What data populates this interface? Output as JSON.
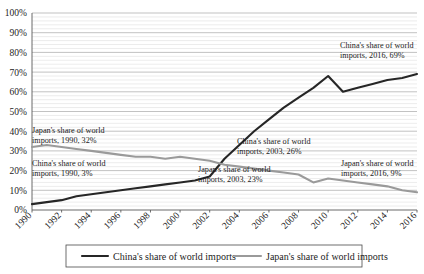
{
  "chart_data": {
    "type": "line",
    "title": "",
    "xlabel": "",
    "ylabel": "",
    "ylim": [
      0,
      100
    ],
    "xlim": [
      1990,
      2016
    ],
    "grid": true,
    "legend_position": "bottom",
    "y_ticks": [
      "0%",
      "10%",
      "20%",
      "30%",
      "40%",
      "50%",
      "60%",
      "70%",
      "80%",
      "90%",
      "100%"
    ],
    "y_tick_values": [
      0,
      10,
      20,
      30,
      40,
      50,
      60,
      70,
      80,
      90,
      100
    ],
    "x_ticks": [
      "1990",
      "1992",
      "1994",
      "1996",
      "1998",
      "2000",
      "2002",
      "2004",
      "2006",
      "2008",
      "2010",
      "2012",
      "2014",
      "2016"
    ],
    "x": [
      1990,
      1991,
      1992,
      1993,
      1994,
      1995,
      1996,
      1997,
      1998,
      1999,
      2000,
      2001,
      2002,
      2003,
      2004,
      2005,
      2006,
      2007,
      2008,
      2009,
      2010,
      2011,
      2012,
      2013,
      2014,
      2015,
      2016
    ],
    "series": [
      {
        "name": "China's share of world imports",
        "color": "#262626",
        "values": [
          3,
          4,
          5,
          7,
          8,
          9,
          10,
          11,
          12,
          13,
          14,
          15,
          17,
          26,
          33,
          40,
          46,
          52,
          57,
          62,
          68,
          60,
          62,
          64,
          66,
          67,
          69
        ]
      },
      {
        "name": "Japan's share of world imports",
        "color": "#9a9a9a",
        "values": [
          32,
          33,
          32,
          31,
          30,
          29,
          28,
          27,
          27,
          26,
          27,
          26,
          25,
          23,
          22,
          21,
          20,
          19,
          18,
          14,
          16,
          15,
          14,
          13,
          12,
          10,
          9
        ]
      }
    ],
    "annotations": [
      {
        "id": "japan-1990",
        "text_line1": "Japan's share of world",
        "text_line2": "imports, 1990, 32%",
        "x": 32,
        "y": 133,
        "value": 32,
        "year": 1990,
        "series": "japan"
      },
      {
        "id": "china-1990",
        "text_line1": "China's share of world",
        "text_line2": "imports, 1990, 3%",
        "x": 32,
        "y": 166,
        "value": 3,
        "year": 1990,
        "series": "china"
      },
      {
        "id": "china-2003",
        "text_line1": "China's share of world",
        "text_line2": "imports, 2003, 26%",
        "x": 237,
        "y": 144,
        "value": 26,
        "year": 2003,
        "series": "china"
      },
      {
        "id": "japan-2003",
        "text_line1": "Japan's share of world",
        "text_line2": "imports, 2003, 23%",
        "x": 198,
        "y": 172,
        "value": 23,
        "year": 2003,
        "series": "japan"
      },
      {
        "id": "china-2016",
        "text_line1": "China's share of world",
        "text_line2": "imports, 2016, 69%",
        "x": 340,
        "y": 48,
        "value": 69,
        "year": 2016,
        "series": "china"
      },
      {
        "id": "japan-2016",
        "text_line1": "Japan's share of world",
        "text_line2": "imports, 2016, 9%",
        "x": 341,
        "y": 166,
        "value": 9,
        "year": 2016,
        "series": "japan"
      }
    ]
  },
  "legend": {
    "items": [
      {
        "label": "China's share of world imports",
        "color": "#262626"
      },
      {
        "label": "Japan's share of world imports",
        "color": "#9a9a9a"
      }
    ]
  }
}
